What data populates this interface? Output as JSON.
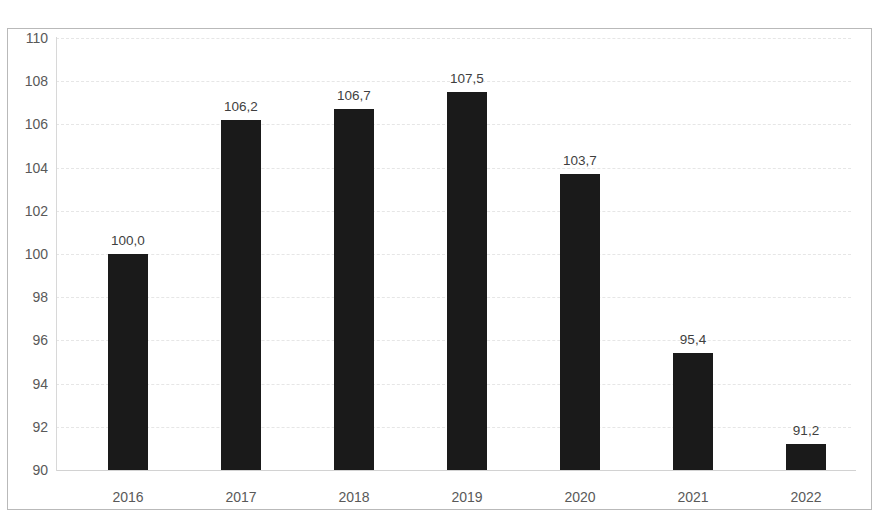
{
  "chart_data": {
    "type": "bar",
    "title": "",
    "xlabel": "",
    "ylabel": "",
    "categories": [
      "2016",
      "2017",
      "2018",
      "2019",
      "2020",
      "2021",
      "2022"
    ],
    "values": [
      100.0,
      106.2,
      106.7,
      107.5,
      103.7,
      95.4,
      91.2
    ],
    "value_labels": [
      "100,0",
      "106,2",
      "106,7",
      "107,5",
      "103,7",
      "95,4",
      "91,2"
    ],
    "ylim": [
      90,
      110
    ],
    "ytick_step": 2,
    "ytick_labels": [
      "110",
      "108",
      "106",
      "104",
      "102",
      "100",
      "98",
      "96",
      "94",
      "92",
      "90"
    ],
    "grid": true,
    "grid_axis": "y",
    "legend": "none",
    "decimal_separator": ",",
    "bar_color": "#1a1a1a",
    "gridline_color": "#e6e6e6",
    "axis_text_color": "#595959",
    "value_label_color": "#3f3f3f",
    "frame_border_color": "#b9b9b9",
    "background_color": "#ffffff"
  }
}
